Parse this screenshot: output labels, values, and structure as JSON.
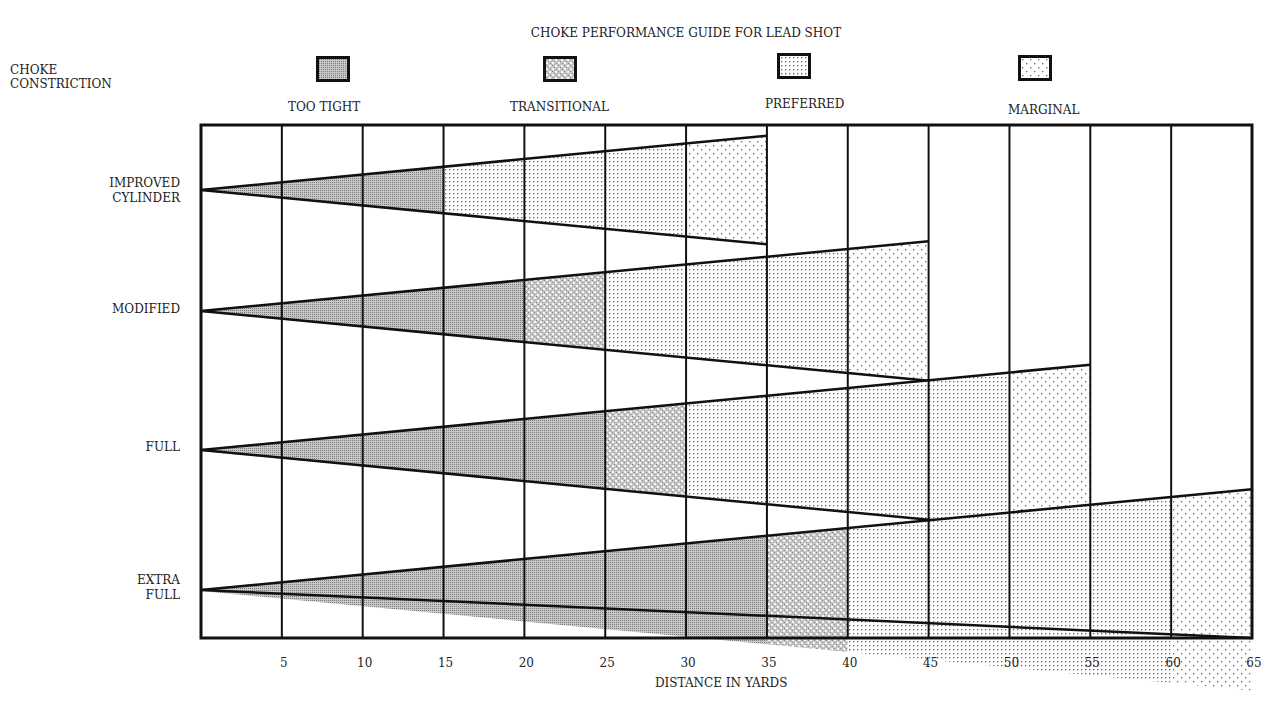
{
  "chart_data": {
    "type": "diagram-bar",
    "title": "CHOKE PERFORMANCE GUIDE FOR LEAD SHOT",
    "ylabel": "CHOKE CONSTRICTION",
    "xlabel": "DISTANCE IN YARDS",
    "x_ticks": [
      5,
      10,
      15,
      20,
      25,
      30,
      35,
      40,
      45,
      50,
      55,
      60,
      65
    ],
    "xlim": [
      0,
      65
    ],
    "grid": true,
    "legend_position": "top",
    "legend": [
      {
        "key": "too_tight",
        "label": "TOO TIGHT"
      },
      {
        "key": "transitional",
        "label": "TRANSITIONAL"
      },
      {
        "key": "preferred",
        "label": "PREFERRED"
      },
      {
        "key": "marginal",
        "label": "MARGINAL"
      }
    ],
    "categories": [
      "IMPROVED CYLINDER",
      "MODIFIED",
      "FULL",
      "EXTRA FULL"
    ],
    "series": [
      {
        "name": "IMPROVED CYLINDER",
        "segments": [
          {
            "zone": "too_tight",
            "from": 0,
            "to": 15
          },
          {
            "zone": "preferred",
            "from": 15,
            "to": 30
          },
          {
            "zone": "marginal",
            "from": 30,
            "to": 35
          }
        ]
      },
      {
        "name": "MODIFIED",
        "segments": [
          {
            "zone": "too_tight",
            "from": 0,
            "to": 20
          },
          {
            "zone": "transitional",
            "from": 20,
            "to": 25
          },
          {
            "zone": "preferred",
            "from": 25,
            "to": 40
          },
          {
            "zone": "marginal",
            "from": 40,
            "to": 45
          }
        ]
      },
      {
        "name": "FULL",
        "segments": [
          {
            "zone": "too_tight",
            "from": 0,
            "to": 25
          },
          {
            "zone": "transitional",
            "from": 25,
            "to": 30
          },
          {
            "zone": "preferred",
            "from": 30,
            "to": 50
          },
          {
            "zone": "marginal",
            "from": 50,
            "to": 55
          }
        ]
      },
      {
        "name": "EXTRA FULL",
        "segments": [
          {
            "zone": "too_tight",
            "from": 0,
            "to": 35
          },
          {
            "zone": "transitional",
            "from": 35,
            "to": 40
          },
          {
            "zone": "preferred",
            "from": 40,
            "to": 60
          },
          {
            "zone": "marginal",
            "from": 60,
            "to": 65
          }
        ]
      }
    ]
  },
  "header": {
    "title": "CHOKE PERFORMANCE GUIDE FOR LEAD SHOT",
    "choke_label_line1": "CHOKE",
    "choke_label_line2": "CONSTRICTION"
  },
  "legend": {
    "too_tight": "TOO TIGHT",
    "transitional": "TRANSITIONAL",
    "preferred": "PREFERRED",
    "marginal": "MARGINAL"
  },
  "rows": {
    "improved_line1": "IMPROVED",
    "improved_line2": "CYLINDER",
    "modified": "MODIFIED",
    "full": "FULL",
    "extra_line1": "EXTRA",
    "extra_line2": "FULL"
  },
  "axis": {
    "ticks": [
      "5",
      "10",
      "15",
      "20",
      "25",
      "30",
      "35",
      "40",
      "45",
      "50",
      "55",
      "60",
      "65"
    ],
    "label": "DISTANCE IN YARDS"
  }
}
